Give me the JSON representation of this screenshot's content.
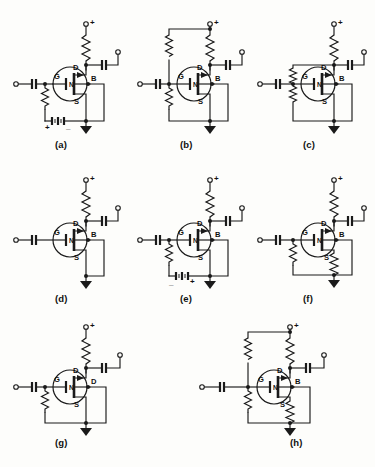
{
  "figure": {
    "caption": "",
    "background_color": "#fdfdfb",
    "line_color": "#1a1a1a",
    "device_label": "N",
    "terminal_labels": {
      "gate": "G",
      "drain": "D",
      "source": "S",
      "body": "B"
    },
    "supply_label": "+",
    "battery_plus": "+",
    "battery_minus": "_",
    "rows": 3,
    "columns": 3
  },
  "circuits": [
    {
      "id": "a",
      "label": "(a)",
      "terminals": {
        "left": "G",
        "top": "D",
        "bottom": "S",
        "right": "B"
      },
      "channel_label": "N",
      "supply": "+",
      "features": [
        "drain-resistor",
        "input-capacitor",
        "output-capacitor",
        "gate-resistor",
        "source-battery",
        "ground"
      ],
      "battery_polarity": [
        "+",
        "_"
      ]
    },
    {
      "id": "b",
      "label": "(b)",
      "terminals": {
        "left": "G",
        "top": "D",
        "bottom": "S",
        "right": "B"
      },
      "channel_label": "N",
      "supply": "+",
      "features": [
        "drain-resistor",
        "input-capacitor",
        "output-capacitor",
        "divider-upper-resistor",
        "divider-lower-resistor",
        "ground"
      ],
      "battery_polarity": []
    },
    {
      "id": "c",
      "label": "(c)",
      "terminals": {
        "left": "G",
        "top": "D",
        "bottom": "S",
        "right": "B"
      },
      "channel_label": "N",
      "supply": "+",
      "features": [
        "drain-resistor",
        "input-capacitor",
        "output-capacitor",
        "feedback-upper-resistor",
        "feedback-lower-resistor",
        "ground"
      ],
      "battery_polarity": []
    },
    {
      "id": "d",
      "label": "(d)",
      "terminals": {
        "left": "G",
        "top": "D",
        "bottom": "S",
        "right": "B"
      },
      "channel_label": "N",
      "supply": "+",
      "features": [
        "drain-resistor",
        "input-capacitor",
        "output-capacitor",
        "ground"
      ],
      "battery_polarity": []
    },
    {
      "id": "e",
      "label": "(e)",
      "terminals": {
        "left": "G",
        "top": "D",
        "bottom": "S",
        "right": "B"
      },
      "channel_label": "N",
      "supply": "+",
      "features": [
        "drain-resistor",
        "input-capacitor",
        "output-capacitor",
        "gate-resistor",
        "source-battery",
        "ground"
      ],
      "battery_polarity": [
        "_",
        "+"
      ]
    },
    {
      "id": "f",
      "label": "(f)",
      "terminals": {
        "left": "G",
        "top": "D",
        "bottom": "S",
        "right": "B"
      },
      "channel_label": "N",
      "supply": "+",
      "features": [
        "drain-resistor",
        "input-capacitor",
        "output-capacitor",
        "gate-resistor",
        "source-resistor",
        "ground"
      ],
      "battery_polarity": []
    },
    {
      "id": "g",
      "label": "(g)",
      "terminals": {
        "left": "G",
        "top": "D",
        "bottom": "S",
        "right": "D"
      },
      "channel_label": "N",
      "supply": "+",
      "features": [
        "drain-resistor",
        "input-capacitor",
        "output-capacitor",
        "gate-resistor",
        "ground"
      ],
      "battery_polarity": []
    },
    {
      "id": "h",
      "label": "(h)",
      "terminals": {
        "left": "G",
        "top": "D",
        "bottom": "S",
        "right": "B"
      },
      "channel_label": "N",
      "supply": "+",
      "features": [
        "drain-resistor",
        "input-capacitor",
        "output-capacitor",
        "divider-upper-resistor",
        "divider-lower-resistor",
        "source-resistor",
        "ground"
      ],
      "battery_polarity": []
    }
  ]
}
